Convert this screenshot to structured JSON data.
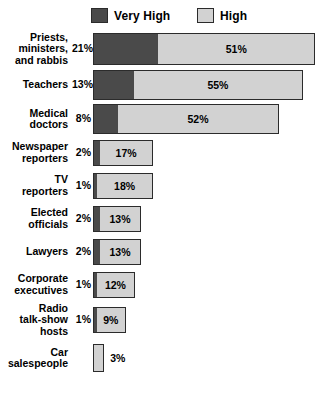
{
  "legend": {
    "items": [
      {
        "label": "Very High",
        "color": "#4a4a4a",
        "key": "very_high"
      },
      {
        "label": "High",
        "color": "#d2d2d2",
        "key": "high"
      }
    ]
  },
  "chart_data": {
    "type": "bar",
    "orientation": "horizontal",
    "stacked": true,
    "title": "",
    "xlabel": "",
    "ylabel": "",
    "grid": false,
    "legend_position": "top",
    "xlim": [
      0,
      72
    ],
    "categories": [
      "Priests, ministers, and rabbis",
      "Teachers",
      "Medical doctors",
      "Newspaper reporters",
      "TV reporters",
      "Elected officials",
      "Lawyers",
      "Corporate executives",
      "Radio talk-show hosts",
      "Car salespeople"
    ],
    "series": [
      {
        "name": "Very High",
        "color": "#4a4a4a",
        "values": [
          21,
          13,
          8,
          2,
          1,
          2,
          2,
          1,
          1,
          0
        ]
      },
      {
        "name": "High",
        "color": "#d2d2d2",
        "values": [
          51,
          55,
          52,
          17,
          18,
          13,
          13,
          12,
          9,
          3
        ]
      }
    ]
  },
  "rows": [
    {
      "label": "Priests,\nministers,\nand rabbis",
      "very_high_label": "21%",
      "high_label": "51%",
      "high_label_outside": false
    },
    {
      "label": "Teachers",
      "very_high_label": "13%",
      "high_label": "55%",
      "high_label_outside": false
    },
    {
      "label": "Medical\ndoctors",
      "very_high_label": "8%",
      "high_label": "52%",
      "high_label_outside": false
    },
    {
      "label": "Newspaper\nreporters",
      "very_high_label": "2%",
      "high_label": "17%",
      "high_label_outside": false
    },
    {
      "label": "TV\nreporters",
      "very_high_label": "1%",
      "high_label": "18%",
      "high_label_outside": false
    },
    {
      "label": "Elected\nofficials",
      "very_high_label": "2%",
      "high_label": "13%",
      "high_label_outside": false
    },
    {
      "label": "Lawyers",
      "very_high_label": "2%",
      "high_label": "13%",
      "high_label_outside": false
    },
    {
      "label": "Corporate\nexecutives",
      "very_high_label": "1%",
      "high_label": "12%",
      "high_label_outside": false
    },
    {
      "label": "Radio\ntalk-show\nhosts",
      "very_high_label": "1%",
      "high_label": "9%",
      "high_label_outside": false
    },
    {
      "label": "Car\nsalespeople",
      "very_high_label": "",
      "high_label": "3%",
      "high_label_outside": true
    }
  ]
}
